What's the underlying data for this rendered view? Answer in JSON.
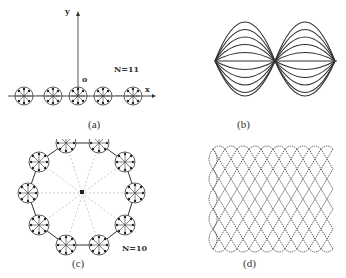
{
  "figure": {
    "panels": [
      {
        "id": "a",
        "label": "(a)",
        "type": "linear-chain",
        "n_label": "N=11",
        "axis_x": "x",
        "axis_y": "y",
        "origin": "o",
        "visible_units": 5
      },
      {
        "id": "b",
        "label": "(b)",
        "type": "standing-wave-modes",
        "lobes": 2,
        "curves_per_half": 6
      },
      {
        "id": "c",
        "label": "(c)",
        "type": "ring",
        "n_label": "N=10",
        "center": "o",
        "units": 10
      },
      {
        "id": "d",
        "label": "(d)",
        "type": "wave-lattice",
        "columns": 10
      }
    ],
    "caption_partial": ""
  },
  "colors": {
    "ink": "#333333",
    "dotted": "#999999",
    "background": "#ffffff"
  }
}
